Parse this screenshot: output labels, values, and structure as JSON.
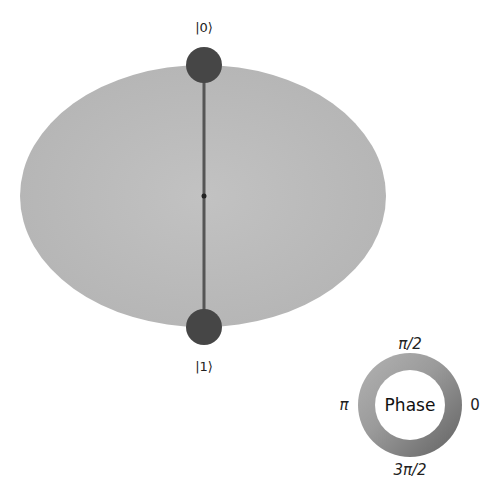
{
  "figure": {
    "type": "qsphere",
    "sphere_color": "#bdbdbd",
    "state_line_color": "#555555",
    "marker_color": "#444444",
    "center_point_color": "#222222"
  },
  "states": [
    {
      "label": "|0⟩",
      "position": "top"
    },
    {
      "label": "|1⟩",
      "position": "bottom"
    }
  ],
  "phase_legend": {
    "title": "Phase",
    "ticks": {
      "top": "π/2",
      "left": "π",
      "right": "0",
      "bottom": "3π/2"
    }
  }
}
